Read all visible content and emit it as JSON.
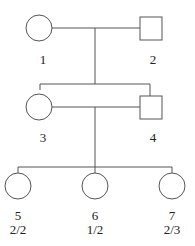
{
  "diagram": {
    "type": "pedigree",
    "line_color": "#555555",
    "individuals": [
      {
        "id": "1",
        "sex": "female",
        "label": "1",
        "genotype": ""
      },
      {
        "id": "2",
        "sex": "male",
        "label": "2",
        "genotype": ""
      },
      {
        "id": "3",
        "sex": "female",
        "label": "3",
        "genotype": ""
      },
      {
        "id": "4",
        "sex": "male",
        "label": "4",
        "genotype": ""
      },
      {
        "id": "5",
        "sex": "female",
        "label": "5",
        "genotype": "2/2"
      },
      {
        "id": "6",
        "sex": "female",
        "label": "6",
        "genotype": "1/2"
      },
      {
        "id": "7",
        "sex": "female",
        "label": "7",
        "genotype": "2/3"
      }
    ]
  }
}
